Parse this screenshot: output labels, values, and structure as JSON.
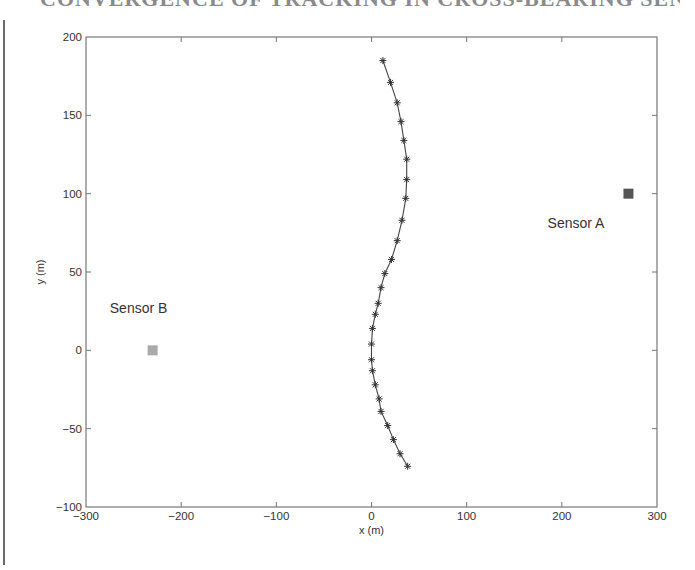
{
  "page": {
    "heading_fragment": "CONVERGENCE OF TRACKING IN CROSS-BEARING SENSOR GEOMETRY"
  },
  "chart_data": {
    "type": "line",
    "title": "",
    "xlabel": "x (m)",
    "ylabel": "y (m)",
    "xlim": [
      -300,
      300
    ],
    "ylim": [
      -100,
      200
    ],
    "x_ticks": [
      -300,
      -200,
      -100,
      0,
      100,
      200,
      300
    ],
    "y_ticks": [
      -100,
      -50,
      0,
      50,
      100,
      150,
      200
    ],
    "x_tick_labels": [
      "−300",
      "−200",
      "−100",
      "0",
      "100",
      "200",
      "300"
    ],
    "y_tick_labels": [
      "−100",
      "−50",
      "0",
      "50",
      "100",
      "150",
      "200"
    ],
    "grid": false,
    "legend": null,
    "series": [
      {
        "name": "target trajectory",
        "marker": "asterisk",
        "line": "solid",
        "color": "#444444",
        "x": [
          12,
          20,
          27,
          31,
          34,
          37,
          37,
          36,
          32,
          27,
          21,
          14,
          10,
          7,
          4,
          1,
          0,
          0,
          1,
          4,
          8,
          10,
          17,
          23,
          30,
          38
        ],
        "y": [
          185,
          171,
          158,
          146,
          134,
          122,
          109,
          97,
          83,
          70,
          58,
          49,
          40,
          30,
          23,
          14,
          4,
          -6,
          -13,
          -22,
          -31,
          -39,
          -48,
          -57,
          -66,
          -74
        ]
      }
    ],
    "points": [
      {
        "name": "Sensor A",
        "x": 270,
        "y": 100,
        "marker": "square",
        "color": "#555555",
        "label_pos": [
          185,
          78
        ]
      },
      {
        "name": "Sensor B",
        "x": -230,
        "y": 0,
        "marker": "square",
        "color": "#aaaaaa",
        "label_pos": [
          -275,
          24
        ]
      }
    ],
    "annotations": [
      {
        "text": "Sensor A",
        "x": 185,
        "y": 78
      },
      {
        "text": "Sensor B",
        "x": -275,
        "y": 24
      }
    ]
  }
}
